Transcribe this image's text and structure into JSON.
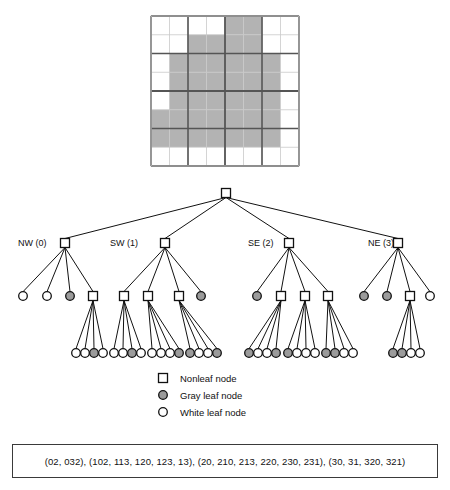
{
  "figure": {
    "type": "quadtree-diagram",
    "title": "",
    "grid": {
      "size": 8,
      "x": 151,
      "y": 16,
      "w": 148,
      "h": 150,
      "gray_color": "#b3b3b3",
      "white_color": "#ffffff",
      "thin_line_color": "#c9c9c9",
      "thick_line_color": "#555555",
      "cells": [
        [
          0,
          0,
          0,
          0,
          1,
          1,
          0,
          0
        ],
        [
          0,
          0,
          1,
          1,
          1,
          1,
          0,
          0
        ],
        [
          0,
          1,
          1,
          1,
          1,
          1,
          1,
          0
        ],
        [
          0,
          1,
          1,
          1,
          1,
          1,
          1,
          0
        ],
        [
          0,
          1,
          1,
          1,
          1,
          1,
          1,
          0
        ],
        [
          1,
          1,
          1,
          1,
          1,
          1,
          1,
          0
        ],
        [
          1,
          1,
          1,
          1,
          1,
          1,
          1,
          0
        ],
        [
          0,
          0,
          0,
          0,
          0,
          0,
          0,
          0
        ]
      ]
    },
    "quadrant_labels": [
      {
        "text": "NW (0)",
        "x": 18,
        "y": 238
      },
      {
        "text": "SW (1)",
        "x": 110,
        "y": 238
      },
      {
        "text": "SE (2)",
        "x": 248,
        "y": 238
      },
      {
        "text": "NE (3)",
        "x": 368,
        "y": 238
      }
    ],
    "tree": {
      "root": {
        "kind": "nonleaf",
        "x": 226,
        "y": 193
      },
      "level1": [
        {
          "id": "0",
          "kind": "nonleaf",
          "x": 65,
          "y": 243
        },
        {
          "id": "1",
          "kind": "nonleaf",
          "x": 165,
          "y": 243
        },
        {
          "id": "2",
          "kind": "nonleaf",
          "x": 289,
          "y": 243
        },
        {
          "id": "3",
          "kind": "nonleaf",
          "x": 398,
          "y": 243
        }
      ],
      "level2": [
        {
          "parent": "0",
          "id": "00",
          "kind": "white",
          "x": 23,
          "y": 296
        },
        {
          "parent": "0",
          "id": "01",
          "kind": "white",
          "x": 47,
          "y": 296
        },
        {
          "parent": "0",
          "id": "02",
          "kind": "gray",
          "x": 70,
          "y": 296
        },
        {
          "parent": "0",
          "id": "03",
          "kind": "nonleaf",
          "x": 93,
          "y": 296
        },
        {
          "parent": "1",
          "id": "10",
          "kind": "nonleaf",
          "x": 124,
          "y": 296
        },
        {
          "parent": "1",
          "id": "11",
          "kind": "nonleaf",
          "x": 148,
          "y": 296
        },
        {
          "parent": "1",
          "id": "12",
          "kind": "nonleaf",
          "x": 179,
          "y": 296
        },
        {
          "parent": "1",
          "id": "13",
          "kind": "gray",
          "x": 201,
          "y": 296
        },
        {
          "parent": "2",
          "id": "20",
          "kind": "gray",
          "x": 257,
          "y": 296
        },
        {
          "parent": "2",
          "id": "21",
          "kind": "nonleaf",
          "x": 281,
          "y": 296
        },
        {
          "parent": "2",
          "id": "22",
          "kind": "nonleaf",
          "x": 305,
          "y": 296
        },
        {
          "parent": "2",
          "id": "23",
          "kind": "nonleaf",
          "x": 328,
          "y": 296
        },
        {
          "parent": "3",
          "id": "30",
          "kind": "gray",
          "x": 364,
          "y": 296
        },
        {
          "parent": "3",
          "id": "31",
          "kind": "gray",
          "x": 387,
          "y": 296
        },
        {
          "parent": "3",
          "id": "32",
          "kind": "nonleaf",
          "x": 410,
          "y": 296
        },
        {
          "parent": "3",
          "id": "33",
          "kind": "white",
          "x": 430,
          "y": 296
        }
      ],
      "level3": [
        {
          "parent": "03",
          "id": "030",
          "kind": "white",
          "x": 76,
          "y": 353
        },
        {
          "parent": "03",
          "id": "031",
          "kind": "white",
          "x": 85,
          "y": 353
        },
        {
          "parent": "03",
          "id": "032",
          "kind": "gray",
          "x": 94,
          "y": 353
        },
        {
          "parent": "03",
          "id": "033",
          "kind": "white",
          "x": 103,
          "y": 353
        },
        {
          "parent": "10",
          "id": "100",
          "kind": "white",
          "x": 114,
          "y": 353
        },
        {
          "parent": "10",
          "id": "101",
          "kind": "white",
          "x": 123,
          "y": 353
        },
        {
          "parent": "10",
          "id": "102",
          "kind": "gray",
          "x": 132,
          "y": 353
        },
        {
          "parent": "10",
          "id": "103",
          "kind": "white",
          "x": 141,
          "y": 353
        },
        {
          "parent": "11",
          "id": "110",
          "kind": "white",
          "x": 152,
          "y": 353
        },
        {
          "parent": "11",
          "id": "111",
          "kind": "white",
          "x": 161,
          "y": 353
        },
        {
          "parent": "11",
          "id": "112",
          "kind": "white",
          "x": 170,
          "y": 353
        },
        {
          "parent": "11",
          "id": "113",
          "kind": "gray",
          "x": 179,
          "y": 353
        },
        {
          "parent": "12",
          "id": "120",
          "kind": "gray",
          "x": 190,
          "y": 353
        },
        {
          "parent": "12",
          "id": "121",
          "kind": "white",
          "x": 199,
          "y": 353
        },
        {
          "parent": "12",
          "id": "122",
          "kind": "white",
          "x": 208,
          "y": 353
        },
        {
          "parent": "12",
          "id": "123",
          "kind": "gray",
          "x": 217,
          "y": 353
        },
        {
          "parent": "21",
          "id": "210",
          "kind": "gray",
          "x": 249,
          "y": 353
        },
        {
          "parent": "21",
          "id": "211",
          "kind": "white",
          "x": 258,
          "y": 353
        },
        {
          "parent": "21",
          "id": "212",
          "kind": "white",
          "x": 267,
          "y": 353
        },
        {
          "parent": "21",
          "id": "213",
          "kind": "gray",
          "x": 276,
          "y": 353
        },
        {
          "parent": "22",
          "id": "220",
          "kind": "gray",
          "x": 288,
          "y": 353
        },
        {
          "parent": "22",
          "id": "221",
          "kind": "white",
          "x": 297,
          "y": 353
        },
        {
          "parent": "22",
          "id": "222",
          "kind": "white",
          "x": 306,
          "y": 353
        },
        {
          "parent": "22",
          "id": "223",
          "kind": "white",
          "x": 315,
          "y": 353
        },
        {
          "parent": "23",
          "id": "230",
          "kind": "gray",
          "x": 326,
          "y": 353
        },
        {
          "parent": "23",
          "id": "231",
          "kind": "gray",
          "x": 335,
          "y": 353
        },
        {
          "parent": "23",
          "id": "232",
          "kind": "white",
          "x": 344,
          "y": 353
        },
        {
          "parent": "23",
          "id": "233",
          "kind": "white",
          "x": 353,
          "y": 353
        },
        {
          "parent": "32",
          "id": "320",
          "kind": "gray",
          "x": 393,
          "y": 353
        },
        {
          "parent": "32",
          "id": "321",
          "kind": "gray",
          "x": 402,
          "y": 353
        },
        {
          "parent": "32",
          "id": "322",
          "kind": "white",
          "x": 411,
          "y": 353
        },
        {
          "parent": "32",
          "id": "323",
          "kind": "white",
          "x": 420,
          "y": 353
        }
      ]
    },
    "legend": {
      "x": 163,
      "y": 378,
      "items": [
        {
          "kind": "nonleaf",
          "label": "Nonleaf node"
        },
        {
          "kind": "gray",
          "label": "Gray leaf node"
        },
        {
          "kind": "white",
          "label": "White leaf node"
        }
      ]
    },
    "code_box": {
      "text": "(02, 032), (102, 113, 120, 123, 13), (20, 210, 213, 220, 230, 231), (30, 31, 320, 321)"
    }
  }
}
